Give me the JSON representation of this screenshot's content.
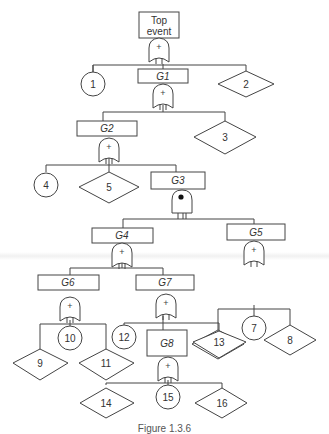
{
  "diagram": {
    "type": "fault-tree",
    "top_event": {
      "label": "Top event",
      "gate": "OR",
      "gate_symbol": "+"
    },
    "gates": [
      {
        "id": "G1",
        "label": "G1",
        "gate": "OR",
        "gate_symbol": "+"
      },
      {
        "id": "G2",
        "label": "G2",
        "gate": "OR",
        "gate_symbol": "+"
      },
      {
        "id": "G3",
        "label": "G3",
        "gate": "priority-AND",
        "gate_symbol": "dot"
      },
      {
        "id": "G4",
        "label": "G4",
        "gate": "OR",
        "gate_symbol": "+"
      },
      {
        "id": "G5",
        "label": "G5",
        "gate": "OR",
        "gate_symbol": "+"
      },
      {
        "id": "G6",
        "label": "G6",
        "gate": "OR",
        "gate_symbol": "+"
      },
      {
        "id": "G7",
        "label": "G7",
        "gate": "OR",
        "gate_symbol": "+"
      },
      {
        "id": "G8",
        "label": "G8",
        "gate": "OR",
        "gate_symbol": "+"
      }
    ],
    "basic_events": [
      "1",
      "4",
      "7",
      "10",
      "12",
      "15"
    ],
    "undeveloped_events": [
      "2",
      "3",
      "5",
      "6",
      "8",
      "9",
      "11",
      "13",
      "14",
      "16"
    ],
    "labels": {
      "top": "Top event",
      "top_line1": "Top",
      "top_line2": "event",
      "or_symbol": "+",
      "G1": "G1",
      "G2": "G2",
      "G3": "G3",
      "G4": "G4",
      "G5": "G5",
      "G6": "G6",
      "G7": "G7",
      "G8": "G8",
      "e1": "1",
      "e2": "2",
      "e3": "3",
      "e4": "4",
      "e5": "5",
      "e6": "6",
      "e7": "7",
      "e8": "8",
      "e9": "9",
      "e10": "10",
      "e11": "11",
      "e12": "12",
      "e13": "13",
      "e14": "14",
      "e15": "15",
      "e16": "16"
    },
    "edges": [
      [
        "Top event",
        "1"
      ],
      [
        "Top event",
        "G1"
      ],
      [
        "Top event",
        "2"
      ],
      [
        "G1",
        "G2"
      ],
      [
        "G1",
        "3"
      ],
      [
        "G2",
        "4"
      ],
      [
        "G2",
        "5"
      ],
      [
        "G2",
        "G3"
      ],
      [
        "G3",
        "G4"
      ],
      [
        "G3",
        "G5"
      ],
      [
        "G4",
        "G6"
      ],
      [
        "G4",
        "G7"
      ],
      [
        "G5",
        "6"
      ],
      [
        "G5",
        "7"
      ],
      [
        "G5",
        "8"
      ],
      [
        "G6",
        "9"
      ],
      [
        "G6",
        "10"
      ],
      [
        "G6",
        "11"
      ],
      [
        "G7",
        "12"
      ],
      [
        "G7",
        "G8"
      ],
      [
        "G7",
        "13"
      ],
      [
        "G8",
        "14"
      ],
      [
        "G8",
        "15"
      ],
      [
        "G8",
        "16"
      ]
    ],
    "caption": "Figure 1.3.6"
  }
}
